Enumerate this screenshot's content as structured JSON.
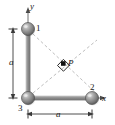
{
  "figure": {
    "background_color": "#ffffff",
    "sphere_color": "#8c8c8c",
    "sphere_highlight_color": "#d4d4d4",
    "sphere_outline_color": "#4a4a4a",
    "rod_color": "#9a9a9a",
    "dashed_line_color": "#b0b0b0",
    "text_color": "#1a1a1a",
    "axes": {
      "y_label": "y",
      "x_label": "x"
    },
    "spheres": [
      {
        "id": "1",
        "label": "1",
        "cx": 28,
        "cy": 29,
        "r": 6.5
      },
      {
        "id": "2",
        "label": "2",
        "cx": 92,
        "cy": 98,
        "r": 6.5
      },
      {
        "id": "3",
        "label": "3",
        "cx": 28,
        "cy": 98,
        "r": 6.5
      }
    ],
    "point": {
      "label": "P",
      "cx": 63,
      "cy": 64,
      "right_angle_marker": true
    },
    "dimensions": [
      {
        "id": "vertical",
        "label": "a",
        "orientation": "vertical",
        "from": 29,
        "to": 98
      },
      {
        "id": "horizontal",
        "label": "a",
        "orientation": "horizontal",
        "from": 28,
        "to": 92
      }
    ]
  }
}
